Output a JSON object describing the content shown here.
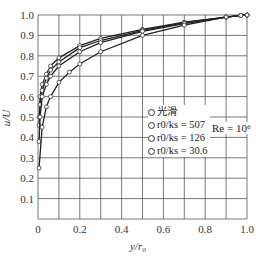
{
  "chart_data": {
    "type": "line",
    "title": "",
    "xlabel": "y/r0",
    "ylabel": "u/U",
    "xlim": [
      0,
      1.0
    ],
    "ylim": [
      0,
      1.0
    ],
    "xticks": [
      "0",
      "0.2",
      "0.4",
      "0.6",
      "0.8",
      "1.0"
    ],
    "yticks": [
      "0.1",
      "0.2",
      "0.3",
      "0.4",
      "0.5",
      "0.6",
      "0.7",
      "0.8",
      "0.9",
      "1.0"
    ],
    "grid": true,
    "legend_position": "center-right",
    "annotation": "Re = 10^6",
    "series": [
      {
        "name": "光滑",
        "x": [
          0.005,
          0.01,
          0.02,
          0.04,
          0.06,
          0.1,
          0.2,
          0.3,
          0.5,
          0.7,
          0.9,
          0.97,
          1.0
        ],
        "y": [
          0.5,
          0.6,
          0.66,
          0.71,
          0.75,
          0.79,
          0.85,
          0.885,
          0.93,
          0.965,
          0.99,
          0.998,
          1.0
        ]
      },
      {
        "name": "r0/ks = 507",
        "x": [
          0.005,
          0.01,
          0.02,
          0.04,
          0.06,
          0.1,
          0.2,
          0.3,
          0.5,
          0.7,
          0.9,
          0.97,
          1.0
        ],
        "y": [
          0.46,
          0.56,
          0.63,
          0.69,
          0.73,
          0.77,
          0.84,
          0.875,
          0.925,
          0.962,
          0.99,
          0.998,
          1.0
        ]
      },
      {
        "name": "r0/ks = 126",
        "x": [
          0.005,
          0.01,
          0.02,
          0.04,
          0.06,
          0.1,
          0.2,
          0.3,
          0.5,
          0.7,
          0.9,
          0.97,
          1.0
        ],
        "y": [
          0.38,
          0.5,
          0.6,
          0.66,
          0.7,
          0.75,
          0.82,
          0.865,
          0.92,
          0.958,
          0.99,
          0.998,
          1.0
        ]
      },
      {
        "name": "r0/ks = 30.6",
        "x": [
          0.005,
          0.02,
          0.04,
          0.06,
          0.1,
          0.15,
          0.2,
          0.3,
          0.5,
          0.7,
          0.9,
          0.97,
          1.0
        ],
        "y": [
          0.25,
          0.45,
          0.55,
          0.6,
          0.67,
          0.72,
          0.76,
          0.82,
          0.9,
          0.95,
          0.99,
          0.998,
          1.0
        ]
      }
    ]
  },
  "legend": {
    "items": [
      "光滑",
      "r0/ks = 507",
      "r0/ks = 126",
      "r0/ks = 30.6"
    ],
    "note": "Re = 10⁶"
  },
  "axes": {
    "xlabel": "y/r₀",
    "ylabel": "u/U"
  }
}
